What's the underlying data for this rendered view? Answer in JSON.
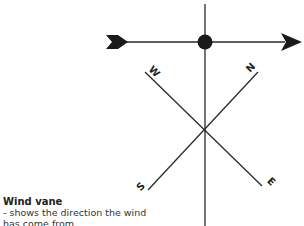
{
  "caption": {
    "title": "Wind vane",
    "line1": "- shows the direction the wind",
    "line2": "has come from"
  },
  "compass": {
    "north": "N",
    "east": "E",
    "south": "S",
    "west": "W"
  },
  "colors": {
    "stroke": "#2a2a2a",
    "background": "#ffffff"
  }
}
